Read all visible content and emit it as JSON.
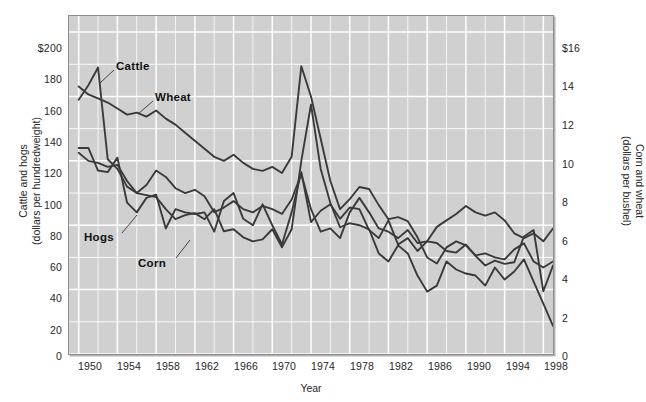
{
  "chart_data": {
    "type": "line",
    "title": "",
    "xlabel": "Year",
    "ylabel": "Cattle and hogs (dollars per hundredweight)",
    "ylabel_right": "Corn and wheat (dollars per bushel)",
    "grid": true,
    "legend_position": "inline-annotations",
    "x": [
      1950,
      1951,
      1952,
      1953,
      1954,
      1955,
      1956,
      1957,
      1958,
      1959,
      1960,
      1961,
      1962,
      1963,
      1964,
      1965,
      1966,
      1967,
      1968,
      1969,
      1970,
      1971,
      1972,
      1973,
      1974,
      1975,
      1976,
      1977,
      1978,
      1979,
      1980,
      1981,
      1982,
      1983,
      1984,
      1985,
      1986,
      1987,
      1988,
      1989,
      1990,
      1991,
      1992,
      1993,
      1994,
      1995,
      1996,
      1997,
      1998,
      1999
    ],
    "xlim": [
      1949,
      1999
    ],
    "xticks": [
      "1950",
      "1954",
      "1958",
      "1962",
      "1966",
      "1970",
      "1974",
      "1978",
      "1982",
      "1986",
      "1990",
      "1994",
      "1998"
    ],
    "ylim": [
      0,
      210
    ],
    "yticks_left": [
      "$200",
      "180",
      "160",
      "140",
      "120",
      "100",
      "80",
      "60",
      "40",
      "20",
      "0"
    ],
    "yticks_right": [
      "$16",
      "14",
      "12",
      "10",
      "8",
      "6",
      "4",
      "2",
      "0"
    ],
    "ylim_right": [
      0,
      16.8
    ],
    "series": [
      {
        "name": "Cattle",
        "axis": "left",
        "unit": "dollars per hundredweight",
        "values": [
          158,
          167,
          178,
          121,
          115,
          104,
          100,
          105,
          114,
          110,
          103,
          100,
          102,
          98,
          88,
          91,
          95,
          90,
          88,
          92,
          90,
          87,
          96,
          112,
          90,
          76,
          78,
          72,
          88,
          97,
          88,
          78,
          76,
          72,
          77,
          69,
          70,
          79,
          83,
          87,
          92,
          88,
          86,
          88,
          83,
          75,
          72,
          75,
          70,
          78
        ]
      },
      {
        "name": "Wheat",
        "axis": "right",
        "unit": "dollars per bushel",
        "values": [
          13.3,
          12.9,
          12.7,
          12.5,
          12.2,
          11.9,
          12.0,
          11.8,
          12.1,
          11.7,
          11.4,
          11.0,
          10.6,
          10.2,
          9.8,
          9.6,
          9.9,
          9.5,
          9.2,
          9.1,
          9.3,
          9.0,
          9.8,
          14.3,
          12.8,
          10.7,
          8.6,
          7.2,
          7.7,
          8.3,
          8.2,
          7.4,
          6.7,
          6.8,
          6.6,
          5.8,
          4.8,
          4.5,
          5.3,
          5.6,
          5.4,
          4.9,
          5.0,
          4.8,
          4.7,
          5.2,
          5.5,
          4.6,
          4.3,
          4.6
        ]
      },
      {
        "name": "Hogs",
        "axis": "left",
        "unit": "dollars per hundredweight",
        "values": [
          128,
          128,
          114,
          113,
          122,
          94,
          88,
          97,
          99,
          78,
          90,
          88,
          87,
          88,
          76,
          95,
          100,
          84,
          80,
          93,
          80,
          68,
          88,
          113,
          82,
          89,
          93,
          84,
          91,
          90,
          77,
          72,
          83,
          68,
          72,
          64,
          70,
          69,
          64,
          63,
          68,
          61,
          55,
          58,
          56,
          57,
          73,
          77,
          39,
          55
        ]
      },
      {
        "name": "Corn",
        "axis": "right",
        "unit": "dollars per bushel",
        "values": [
          10.0,
          9.6,
          9.5,
          9.3,
          9.4,
          8.6,
          8.0,
          7.9,
          7.8,
          7.2,
          6.7,
          6.9,
          7.0,
          6.7,
          7.2,
          6.1,
          6.2,
          5.8,
          5.6,
          5.7,
          6.2,
          5.3,
          6.2,
          9.6,
          12.4,
          9.2,
          7.5,
          6.3,
          6.5,
          6.4,
          6.2,
          5.0,
          4.6,
          5.4,
          5.0,
          3.9,
          3.1,
          3.4,
          4.6,
          4.2,
          4.0,
          3.9,
          3.4,
          4.3,
          3.7,
          4.1,
          4.7,
          3.6,
          2.5,
          1.4
        ]
      }
    ]
  },
  "axes": {
    "left": {
      "title_line1": "Cattle and hogs",
      "title_line2": "(dollars per hundredweight)",
      "ticks": [
        {
          "label": "$200",
          "top": 42
        },
        {
          "label": "180",
          "top": 73
        },
        {
          "label": "160",
          "top": 105
        },
        {
          "label": "140",
          "top": 136
        },
        {
          "label": "120",
          "top": 167
        },
        {
          "label": "100",
          "top": 199
        },
        {
          "label": "80",
          "top": 230
        },
        {
          "label": "60",
          "top": 261
        },
        {
          "label": "40",
          "top": 292
        },
        {
          "label": "20",
          "top": 324
        },
        {
          "label": "0",
          "top": 350
        }
      ]
    },
    "right": {
      "title_line1": "Corn and wheat",
      "title_line2": "(dollars per bushel)",
      "ticks": [
        {
          "label": "$16",
          "top": 42
        },
        {
          "label": "14",
          "top": 80
        },
        {
          "label": "12",
          "top": 119
        },
        {
          "label": "10",
          "top": 158
        },
        {
          "label": "8",
          "top": 196
        },
        {
          "label": "6",
          "top": 235
        },
        {
          "label": "4",
          "top": 273
        },
        {
          "label": "2",
          "top": 312
        },
        {
          "label": "0",
          "top": 350
        }
      ]
    },
    "bottom": {
      "title": "Year",
      "ticks": [
        {
          "label": "1950",
          "left": 67
        },
        {
          "label": "1954",
          "left": 106
        },
        {
          "label": "1958",
          "left": 145
        },
        {
          "label": "1962",
          "left": 184
        },
        {
          "label": "1966",
          "left": 223
        },
        {
          "label": "1970",
          "left": 261
        },
        {
          "label": "1974",
          "left": 300
        },
        {
          "label": "1978",
          "left": 339
        },
        {
          "label": "1982",
          "left": 378
        },
        {
          "label": "1986",
          "left": 417
        },
        {
          "label": "1990",
          "left": 456
        },
        {
          "label": "1994",
          "left": 495
        },
        {
          "label": "1998",
          "left": 533
        }
      ]
    }
  },
  "annotations": {
    "cattle": "Cattle",
    "wheat": "Wheat",
    "hogs": "Hogs",
    "corn": "Corn"
  },
  "colors": {
    "plot_background": "#d0d0d0",
    "gridline": "#ffffff",
    "series_line": "#3a3a3a",
    "frame": "#8c8c8c",
    "text": "#262626"
  }
}
